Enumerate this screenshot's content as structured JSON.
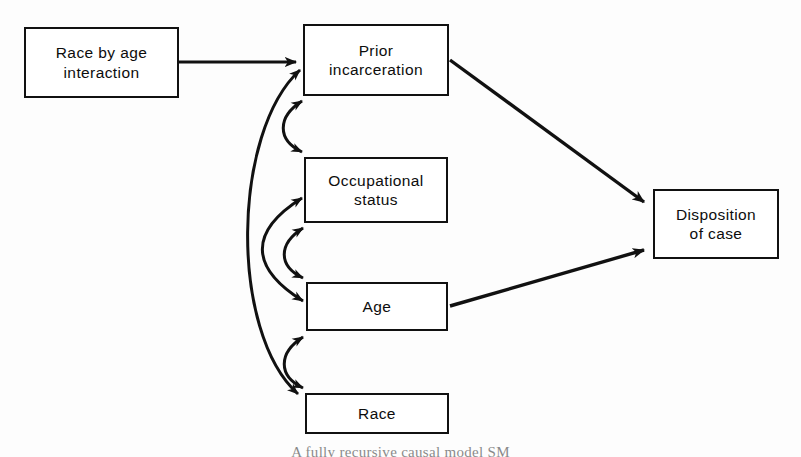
{
  "figure": {
    "title": "Fully recursive causal model",
    "caption": "A fully recursive causal model SM",
    "background_color": "#fdfdfd",
    "line_color": "#111111",
    "text_color": "#0d0d0d"
  },
  "nodes": [
    {
      "id": "race-by-age-interaction",
      "label": "Race by age\ninteraction",
      "x": 24,
      "y": 27,
      "width": 155,
      "height": 71
    },
    {
      "id": "prior-incarceration",
      "label": "Prior\nincarceration",
      "x": 303,
      "y": 24,
      "width": 146,
      "height": 72
    },
    {
      "id": "occupational-status",
      "label": "Occupational\nstatus",
      "x": 304,
      "y": 157,
      "width": 144,
      "height": 66
    },
    {
      "id": "age",
      "label": "Age",
      "x": 306,
      "y": 282,
      "width": 142,
      "height": 49
    },
    {
      "id": "race",
      "label": "Race",
      "x": 305,
      "y": 393,
      "width": 144,
      "height": 41
    },
    {
      "id": "disposition-of-case",
      "label": "Disposition\nof case",
      "x": 653,
      "y": 189,
      "width": 126,
      "height": 70
    }
  ],
  "directed_edges": [
    {
      "id": "interaction-to-prior-incarceration",
      "from": "race-by-age-interaction",
      "to": "prior-incarceration",
      "kind": "straight",
      "path": "M 179 62 L 298 62"
    },
    {
      "id": "prior-incarceration-to-disposition",
      "from": "prior-incarceration",
      "to": "disposition-of-case",
      "kind": "straight",
      "path": "M 450 60 L 646 203"
    },
    {
      "id": "age-to-disposition",
      "from": "age",
      "to": "disposition-of-case",
      "kind": "straight",
      "path": "M 450 306 L 646 249"
    }
  ],
  "correlation_edges": [
    {
      "id": "prior-incarceration-occupational-status",
      "between": [
        "prior-incarceration",
        "occupational-status"
      ],
      "kind": "curved-double-headed",
      "path": "M 301 99 C 276 116, 276 140, 301 153"
    },
    {
      "id": "occupational-status-age",
      "between": [
        "occupational-status",
        "age"
      ],
      "kind": "curved-double-headed",
      "path": "M 302 226 C 277 243, 277 266, 302 279"
    },
    {
      "id": "age-race",
      "between": [
        "age",
        "race"
      ],
      "kind": "curved-double-headed",
      "path": "M 302 334 C 277 351, 277 374, 302 389"
    },
    {
      "id": "prior-incarceration-race",
      "between": [
        "prior-incarceration",
        "race"
      ],
      "kind": "curved-long-double-headed",
      "path": "M 301 68 C 236 130, 232 330, 300 396"
    },
    {
      "id": "occupational-status-age-long",
      "between": [
        "occupational-status",
        "age"
      ],
      "kind": "curved-long-double-headed",
      "path": "M 302 196 C 250 230, 250 268, 303 302"
    }
  ]
}
